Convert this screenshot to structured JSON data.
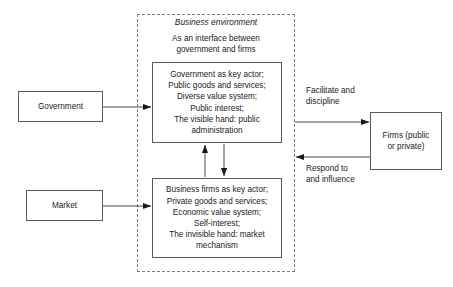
{
  "diagram": {
    "title": "Business environment as an interface between government and firms",
    "region": {
      "name": "business-environment-region",
      "title": "Business environment",
      "subtitle": "As an interface between\ngovernment and firms"
    },
    "nodes": [
      {
        "id": "government",
        "label": "Government"
      },
      {
        "id": "market",
        "label": "Market"
      },
      {
        "id": "public-administration",
        "label": "Government as key actor;\nPublic goods and services;\nDiverse value system;\nPublic interest;\nThe visible hand: public\nadministration"
      },
      {
        "id": "market-mechanism",
        "label": "Business firms as key actor;\nPrivate goods and services;\nEconomic value system;\nSelf-interest;\nThe invisible hand: market\nmechanism"
      },
      {
        "id": "firms",
        "label": "Firms (public\nor private)"
      }
    ],
    "edge_labels": [
      {
        "id": "facilitate-discipline",
        "text": "Facilitate and\ndiscipline"
      },
      {
        "id": "respond-influence",
        "text": "Respond to\nand influence"
      }
    ],
    "colors": {
      "stroke": "#5a5a5a",
      "dashed_stroke": "#7d7d7d",
      "text": "#1a1a1a",
      "background": "#ffffff",
      "arrow": "#1a1a1a"
    }
  }
}
